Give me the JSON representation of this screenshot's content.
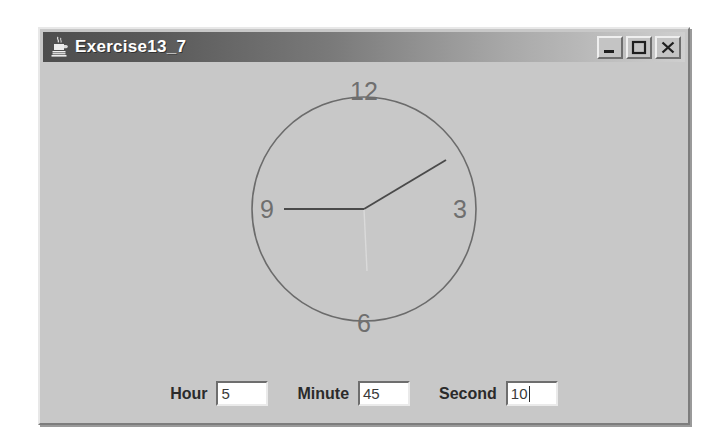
{
  "window": {
    "title": "Exercise13_7",
    "icon": "java-coffee-cup-icon",
    "buttons": {
      "minimize": {
        "name": "minimize-button",
        "glyph": "_"
      },
      "maximize": {
        "name": "maximize-button",
        "glyph": "□"
      },
      "close": {
        "name": "close-button",
        "glyph": "×"
      }
    },
    "background_color": "#c8c8c8",
    "titlebar_color_start": "#4e4e4e",
    "titlebar_color_end": "#cfcfcf"
  },
  "clock": {
    "numerals": [
      {
        "label": "12",
        "position": "top"
      },
      {
        "label": "3",
        "position": "right"
      },
      {
        "label": "6",
        "position": "bottom"
      },
      {
        "label": "9",
        "position": "left"
      }
    ],
    "hands": {
      "hour": {
        "value": 5,
        "color": "#4a4a4a"
      },
      "minute": {
        "value": 45,
        "color": "#4a4a4a"
      },
      "second": {
        "value": 10,
        "color": "#d8d8d8"
      }
    },
    "face_color": "#c8c8c8",
    "rim_color": "#6b6b6b"
  },
  "controls": {
    "hour": {
      "label": "Hour",
      "value": "5",
      "caret": false
    },
    "minute": {
      "label": "Minute",
      "value": "45",
      "caret": false
    },
    "second": {
      "label": "Second",
      "value": "10",
      "caret": true
    }
  }
}
